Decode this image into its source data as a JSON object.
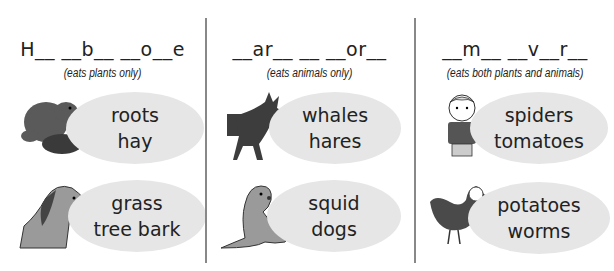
{
  "columns": [
    {
      "heading": "H__ __b__ __o__e",
      "subtitle": "(eats plants only)",
      "rows": [
        {
          "animal": "beaver-icon",
          "foods": [
            "roots",
            "hay"
          ]
        },
        {
          "animal": "horse-icon",
          "foods": [
            "grass",
            "tree bark"
          ]
        }
      ]
    },
    {
      "heading": "__ar__ __ __or__",
      "subtitle": "(eats animals only)",
      "rows": [
        {
          "animal": "wolf-icon",
          "foods": [
            "whales",
            "hares"
          ]
        },
        {
          "animal": "seal-icon",
          "foods": [
            "squid",
            "dogs"
          ]
        }
      ]
    },
    {
      "heading": "__m__ __v__r__",
      "subtitle": "(eats both plants and animals)",
      "rows": [
        {
          "animal": "boy-icon",
          "foods": [
            "spiders",
            "tomatoes"
          ]
        },
        {
          "animal": "hen-icon",
          "foods": [
            "potatoes",
            "worms"
          ]
        }
      ]
    }
  ],
  "colors": {
    "bubble": "#e6e6e6",
    "divider": "#888888",
    "animal_dark": "#4a4a4a",
    "animal_mid": "#8c8c8c"
  }
}
